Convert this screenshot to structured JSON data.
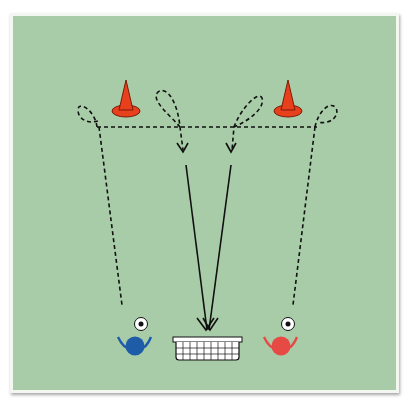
{
  "diagram": {
    "title": "",
    "field_color": "#a9cca8",
    "cone_color": "#e8401c",
    "player_blue": "#1f5ca8",
    "player_red": "#e64a45",
    "elements": [
      "cone-left",
      "cone-right",
      "player-blue",
      "player-red",
      "ball-left",
      "ball-right",
      "goal",
      "dribble-path-left",
      "dribble-path-right",
      "shot-arrows"
    ]
  }
}
